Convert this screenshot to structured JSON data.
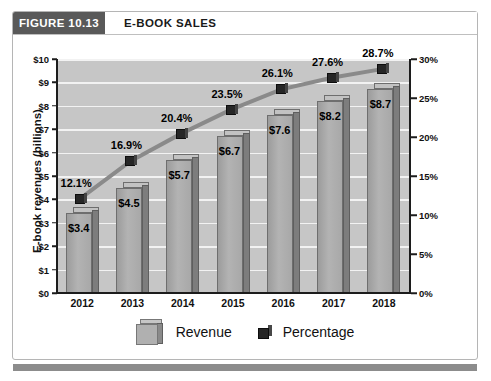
{
  "figure": {
    "tab_label": "FIGURE 10.13",
    "title": "E-BOOK SALES"
  },
  "chart_data": {
    "type": "bar",
    "title": "E-BOOK SALES",
    "categories": [
      "2012",
      "2013",
      "2014",
      "2015",
      "2016",
      "2017",
      "2018"
    ],
    "xlabel": "",
    "ylabel": "E-book revenues (billions)",
    "ylim": [
      0,
      10
    ],
    "y_ticks": [
      "$0",
      "$1",
      "$2",
      "$3",
      "$4",
      "$5",
      "$6",
      "$7",
      "$8",
      "$9",
      "$10"
    ],
    "y2label": "",
    "y2lim": [
      0,
      30
    ],
    "y2_ticks": [
      "0%",
      "5%",
      "10%",
      "15%",
      "20%",
      "25%",
      "30%"
    ],
    "grid": true,
    "legend_position": "bottom",
    "series": [
      {
        "name": "Revenue",
        "type": "bar",
        "axis": "left",
        "values": [
          3.4,
          4.5,
          5.7,
          6.7,
          7.6,
          8.2,
          8.7
        ],
        "labels": [
          "$3.4",
          "$4.5",
          "$5.7",
          "$6.7",
          "$7.6",
          "$8.2",
          "$8.7"
        ]
      },
      {
        "name": "Percentage",
        "type": "line",
        "axis": "right",
        "values": [
          12.1,
          16.9,
          20.4,
          23.5,
          26.1,
          27.6,
          28.7
        ],
        "labels": [
          "12.1%",
          "16.9%",
          "20.4%",
          "23.5%",
          "26.1%",
          "27.6%",
          "28.7%"
        ]
      }
    ]
  },
  "legend": {
    "revenue_label": "Revenue",
    "percentage_label": "Percentage"
  },
  "colors": {
    "tab_background": "#595959",
    "plot_background": "#c6c6c6",
    "gridline": "#f2f2f2",
    "bar_fill": "#b3b3b3",
    "bar_side": "#7d7d7d",
    "line": "#8a8a8a",
    "marker": "#262626",
    "bottom_bar": "#8c8c8c"
  }
}
